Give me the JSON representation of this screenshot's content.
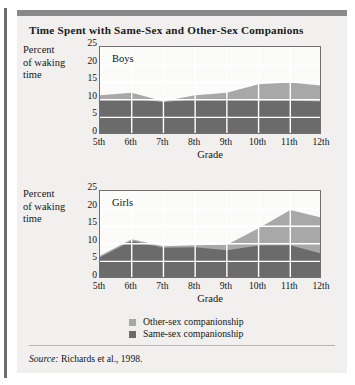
{
  "figure": {
    "title": "Time Spent with Same-Sex and Other-Sex Companions",
    "source_prefix": "Source:",
    "source_text": " Richards et al., 1998."
  },
  "colors": {
    "card_background": "#f1f0ee",
    "top_bar": "#8a8a8a",
    "spine": "#6e6e6e",
    "plot_background": "#fbfbfa",
    "plot_border": "#6f6f6f",
    "gridline": "#ffffff",
    "same_sex": "#6b6b6b",
    "other_sex": "#a8a8a8",
    "text": "#141414"
  },
  "legend": {
    "position": "bottom-center",
    "items": [
      {
        "label": "Other-sex companionship",
        "color": "#a8a8a8",
        "key": "other_sex"
      },
      {
        "label": "Same-sex companionship",
        "color": "#6b6b6b",
        "key": "same_sex"
      }
    ]
  },
  "axis": {
    "y_label_line1": "Percent",
    "y_label_line2": "of waking",
    "y_label_line3": "time",
    "y_ticks": [
      "0",
      "5",
      "10",
      "15",
      "20",
      "25"
    ],
    "x_label": "Grade",
    "x_ticks": [
      "5th",
      "6th",
      "7th",
      "8th",
      "9th",
      "10th",
      "11th",
      "12th"
    ]
  },
  "panels": [
    {
      "key": "boys",
      "title": "Boys"
    },
    {
      "key": "girls",
      "title": "Girls"
    }
  ],
  "chart_data": [
    {
      "type": "area",
      "stacked": true,
      "title": "Boys",
      "xlabel": "Grade",
      "ylabel": "Percent of waking time",
      "categories": [
        "5th",
        "6th",
        "7th",
        "8th",
        "9th",
        "10th",
        "11th",
        "12th"
      ],
      "x": [
        "5th",
        "6th",
        "7th",
        "8th",
        "9th",
        "10th",
        "11th",
        "12th"
      ],
      "ylim": [
        0,
        25
      ],
      "yticks": [
        0,
        5,
        10,
        15,
        20,
        25
      ],
      "grid": true,
      "legend_position": "bottom-center",
      "series": [
        {
          "name": "Same-sex companionship",
          "color": "#6b6b6b",
          "values": [
            10.0,
            10.3,
            9.3,
            10.2,
            10.3,
            9.8,
            9.8,
            9.5
          ]
        },
        {
          "name": "Other-sex companionship",
          "color": "#a8a8a8",
          "values": [
            1.3,
            1.7,
            0.3,
            1.1,
            1.7,
            4.6,
            5.1,
            4.5
          ]
        }
      ],
      "totals": [
        11.3,
        12.0,
        9.6,
        11.3,
        12.0,
        14.4,
        14.9,
        14.0
      ]
    },
    {
      "type": "area",
      "stacked": true,
      "title": "Girls",
      "xlabel": "Grade",
      "ylabel": "Percent of waking time",
      "categories": [
        "5th",
        "6th",
        "7th",
        "8th",
        "9th",
        "10th",
        "11th",
        "12th"
      ],
      "x": [
        "5th",
        "6th",
        "7th",
        "8th",
        "9th",
        "10th",
        "11th",
        "12th"
      ],
      "ylim": [
        0,
        25
      ],
      "yticks": [
        0,
        5,
        10,
        15,
        20,
        25
      ],
      "grid": true,
      "legend_position": "bottom-center",
      "series": [
        {
          "name": "Same-sex companionship",
          "color": "#6b6b6b",
          "values": [
            6.2,
            10.8,
            8.9,
            9.0,
            8.2,
            9.5,
            9.6,
            7.2
          ]
        },
        {
          "name": "Other-sex companionship",
          "color": "#a8a8a8",
          "values": [
            0.4,
            0.5,
            0.4,
            0.6,
            1.5,
            4.9,
            10.0,
            10.2
          ]
        }
      ],
      "totals": [
        6.6,
        11.3,
        9.3,
        9.6,
        9.7,
        14.4,
        19.6,
        17.4
      ]
    }
  ]
}
